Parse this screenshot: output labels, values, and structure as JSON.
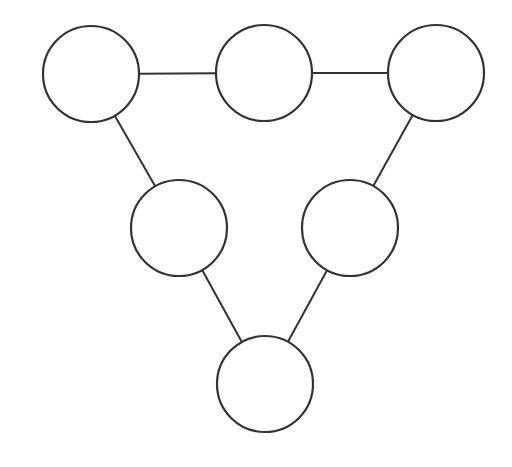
{
  "canvas": {
    "width": 512,
    "height": 467,
    "background": "#ffffff"
  },
  "style": {
    "stroke": "#333333",
    "fill": "#ffffff",
    "radius": 48
  },
  "nodes": [
    {
      "id": "top-left",
      "cx": 91,
      "cy": 74
    },
    {
      "id": "top-middle",
      "cx": 264,
      "cy": 73
    },
    {
      "id": "top-right",
      "cx": 436,
      "cy": 73
    },
    {
      "id": "middle-left",
      "cx": 179,
      "cy": 228
    },
    {
      "id": "middle-right",
      "cx": 350,
      "cy": 228
    },
    {
      "id": "bottom",
      "cx": 265,
      "cy": 384
    }
  ],
  "edges": [
    {
      "from": "top-left",
      "to": "top-middle"
    },
    {
      "from": "top-middle",
      "to": "top-right"
    },
    {
      "from": "top-left",
      "to": "middle-left"
    },
    {
      "from": "top-right",
      "to": "middle-right"
    },
    {
      "from": "middle-left",
      "to": "bottom"
    },
    {
      "from": "middle-right",
      "to": "bottom"
    }
  ]
}
